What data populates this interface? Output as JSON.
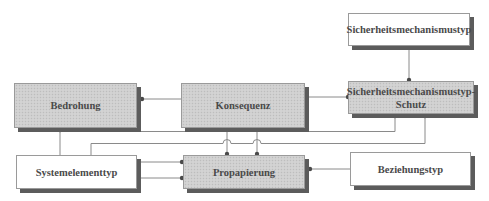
{
  "diagram": {
    "type": "entity-relationship",
    "colors": {
      "entity_fill": "#cfcfcf",
      "type_fill": "#ffffff",
      "border": "#9a9a9a",
      "shadow": "#5c5c5c",
      "line": "#8a8a8a",
      "text": "#4a4a4a"
    },
    "boxes": {
      "sicherheitsmechanismustyp": {
        "label": "Sicherheitsmechanismustyp",
        "style": "white"
      },
      "bedrohung": {
        "label": "Bedrohung",
        "style": "gray"
      },
      "konsequenz": {
        "label": "Konsequenz",
        "style": "gray"
      },
      "schutz": {
        "label": "Sicherheitsmechanismustyp-Schutz",
        "line1": "Sicherheitsmechanismustyp-",
        "line2": "Schutz",
        "style": "gray"
      },
      "systemelementtyp": {
        "label": "Systemelementtyp",
        "style": "white"
      },
      "propapierung": {
        "label": "Propapierung",
        "style": "gray"
      },
      "beziehungstyp": {
        "label": "Beziehungstyp",
        "style": "white"
      }
    },
    "connections": [
      {
        "from": "Bedrohung",
        "to": "Konsequenz"
      },
      {
        "from": "Konsequenz",
        "to": "Sicherheitsmechanismustyp-Schutz"
      },
      {
        "from": "Sicherheitsmechanismustyp",
        "to": "Sicherheitsmechanismustyp-Schutz"
      },
      {
        "from": "Systemelementtyp",
        "to": "Bedrohung"
      },
      {
        "from": "Bedrohung",
        "to": "Sicherheitsmechanismustyp-Schutz"
      },
      {
        "from": "Systemelementtyp",
        "to": "Sicherheitsmechanismustyp-Schutz"
      },
      {
        "from": "Konsequenz",
        "to": "Propapierung"
      },
      {
        "from": "Konsequenz",
        "to": "Propapierung"
      },
      {
        "from": "Systemelementtyp",
        "to": "Propapierung"
      },
      {
        "from": "Systemelementtyp",
        "to": "Propapierung"
      },
      {
        "from": "Beziehungstyp",
        "to": "Propapierung"
      }
    ]
  }
}
